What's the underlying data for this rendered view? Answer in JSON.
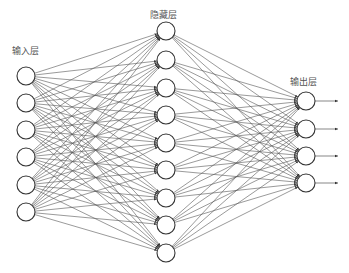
{
  "diagram": {
    "colors": {
      "background": "#ffffff",
      "edge": "#555555",
      "node_stroke": "#333333",
      "node_fill": "#ffffff",
      "label": "#555555"
    },
    "node_radius": 9,
    "layers": [
      {
        "id": "input",
        "label": "输入层",
        "label_pos": {
          "x": 12,
          "y": 46
        },
        "x": 26,
        "ys": [
          76,
          103,
          130,
          157,
          185,
          212
        ]
      },
      {
        "id": "hidden",
        "label": "隐藏层",
        "label_pos": {
          "x": 150,
          "y": 10
        },
        "x": 166,
        "ys": [
          31,
          60,
          88,
          115,
          143,
          170,
          198,
          225,
          253
        ]
      },
      {
        "id": "output",
        "label": "输出层",
        "label_pos": {
          "x": 290,
          "y": 77
        },
        "x": 306,
        "ys": [
          101,
          129,
          156,
          183
        ]
      }
    ],
    "output_arrows": {
      "end_x": 338
    }
  }
}
